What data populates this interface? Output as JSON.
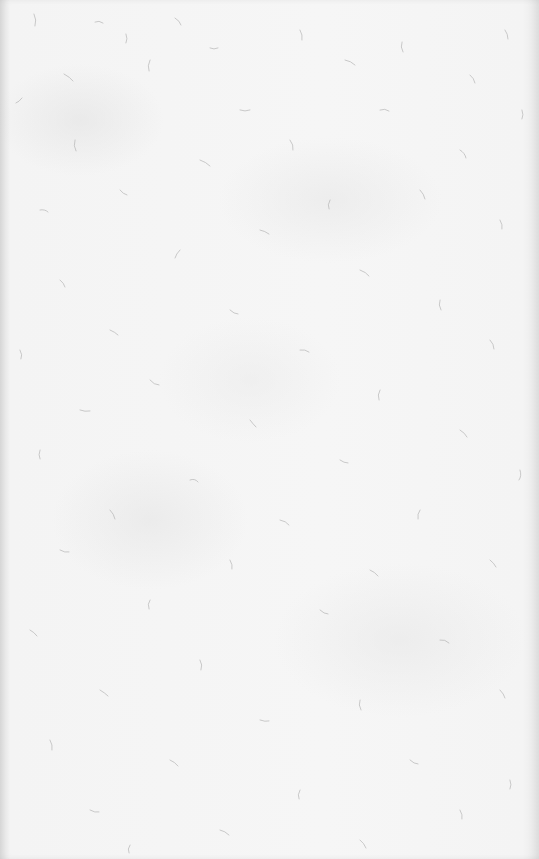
{
  "image": {
    "description": "Blank sheet of textured fiber paper",
    "background_color": "#f6f6f6",
    "fiber_color": "#a8a8a8",
    "width": 539,
    "height": 859
  }
}
